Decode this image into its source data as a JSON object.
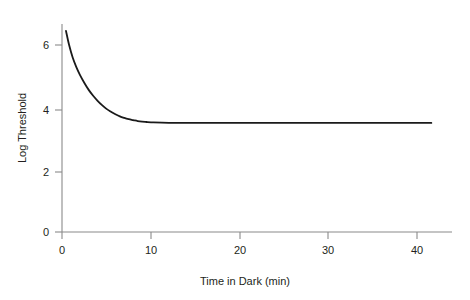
{
  "chart_data": {
    "type": "line",
    "title": "",
    "subtitle": "",
    "xlabel": "Time in Dark (min)",
    "ylabel": "Log Threshold",
    "xlim": [
      0,
      44
    ],
    "ylim": [
      0,
      7.5
    ],
    "xticks": [
      0,
      10,
      20,
      30,
      40
    ],
    "xtick_labels": [
      "0",
      "10",
      "20",
      "30",
      "40"
    ],
    "yticks": [
      0,
      2,
      4,
      6
    ],
    "ytick_labels": [
      "0",
      "2",
      "4",
      "6"
    ],
    "grid": false,
    "legend": null,
    "annotations": [],
    "series": [
      {
        "name": "dark adaptation curve",
        "color": "#1a1a1a",
        "asymptote": 3.5,
        "x": [
          0.45,
          0.8,
          1.2,
          1.6,
          2.0,
          2.5,
          3.0,
          3.5,
          4.0,
          4.5,
          5.0,
          5.5,
          6.0,
          6.5,
          7.0,
          7.5,
          8.0,
          8.5,
          9.0,
          9.5,
          10.0,
          12.0,
          15.0,
          20.0,
          25.0,
          30.0,
          35.0,
          41.5
        ],
        "y": [
          6.45,
          6.0,
          5.6,
          5.3,
          5.05,
          4.79,
          4.56,
          4.37,
          4.21,
          4.07,
          3.95,
          3.86,
          3.78,
          3.71,
          3.66,
          3.62,
          3.59,
          3.56,
          3.54,
          3.53,
          3.52,
          3.5,
          3.5,
          3.5,
          3.5,
          3.5,
          3.5,
          3.5
        ]
      }
    ]
  },
  "axes": {
    "x_axis_name": "x-axis",
    "y_axis_name": "y-axis"
  }
}
